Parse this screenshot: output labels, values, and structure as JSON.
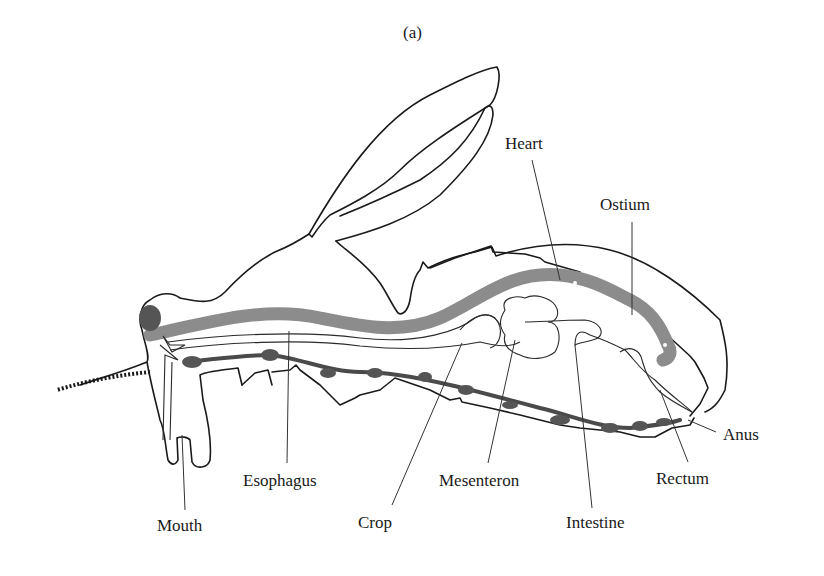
{
  "figure": {
    "caption": "(a)",
    "colors": {
      "outline": "#1a1a1a",
      "heart": "#8c8c8c",
      "nerve_cord": "#4a4a4a",
      "background": "#ffffff"
    }
  },
  "labels": {
    "heart": "Heart",
    "ostium": "Ostium",
    "anus": "Anus",
    "rectum": "Rectum",
    "intestine": "Intestine",
    "mesenteron": "Mesenteron",
    "crop": "Crop",
    "esophagus": "Esophagus",
    "mouth": "Mouth"
  }
}
